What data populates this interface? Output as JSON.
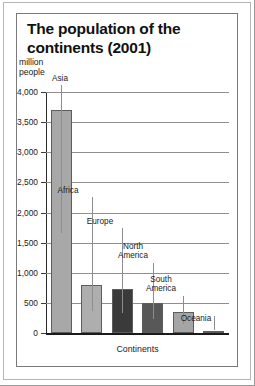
{
  "chart_data": {
    "type": "bar",
    "title": "The population of the continents (2001)",
    "title_lines": [
      "The population of the",
      "continents (2001)"
    ],
    "xlabel": "Continents",
    "ylabel": "million people",
    "ylabel_lines": [
      "million",
      "people"
    ],
    "categories": [
      "Asia",
      "Africa",
      "Europe",
      "North America",
      "South America",
      "Oceania"
    ],
    "values": [
      3700,
      800,
      730,
      500,
      350,
      30
    ],
    "ylim": [
      0,
      4000
    ],
    "ytick_values": [
      0,
      500,
      1000,
      1500,
      2000,
      2500,
      3000,
      3500,
      4000
    ],
    "ytick_labels": [
      "0",
      "500",
      "1,000",
      "1,500",
      "2,000",
      "2,500",
      "3,000",
      "3,500",
      "4,000"
    ],
    "grid": true,
    "legend": "none",
    "bar_colors": [
      "#a8a8a8",
      "#aeaeae",
      "#3a3a3a",
      "#585858",
      "#a5a5a5",
      "#9d9d9d"
    ],
    "point_labels": [
      {
        "name": "Asia",
        "text": "Asia"
      },
      {
        "name": "Africa",
        "text": "Africa"
      },
      {
        "name": "Europe",
        "text": "Europe"
      },
      {
        "name": "North America",
        "text": "North\nAmerica"
      },
      {
        "name": "South America",
        "text": "South\nAmerica"
      },
      {
        "name": "Oceania",
        "text": "Oceania"
      }
    ]
  }
}
